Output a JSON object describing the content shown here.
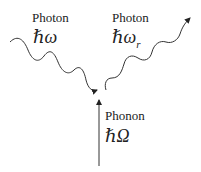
{
  "diagram": {
    "incident_photon": {
      "label": "Photon",
      "energy": "ℏω"
    },
    "scattered_photon": {
      "label": "Photon",
      "energy_base": "ℏω",
      "energy_sub": "r"
    },
    "phonon": {
      "label": "Phonon",
      "energy": "ℏΩ"
    },
    "colors": {
      "line": "#333333",
      "text": "#222222"
    }
  }
}
